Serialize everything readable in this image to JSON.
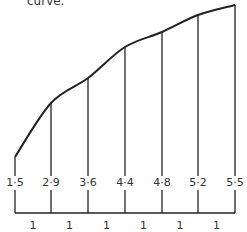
{
  "caption": "curve.",
  "chart_data": {
    "type": "area",
    "title": "",
    "ordinates": [
      1.5,
      2.9,
      3.6,
      4.4,
      4.8,
      5.2,
      5.5
    ],
    "ordinate_labels": [
      "1·5",
      "2·9",
      "3·6",
      "4·4",
      "4·8",
      "5·2",
      "5·5"
    ],
    "strip_widths": [
      1,
      1,
      1,
      1,
      1,
      1
    ],
    "strip_width_labels": [
      "1",
      "1",
      "1",
      "1",
      "1",
      "1"
    ],
    "xlabel": "",
    "ylabel": "",
    "grid": false
  },
  "geometry": {
    "ordinate_x": [
      15,
      51,
      88,
      125,
      162,
      198,
      235
    ],
    "curve_top_y": [
      157,
      103,
      78,
      47,
      32,
      15,
      5
    ],
    "baseline_y": 213
  }
}
